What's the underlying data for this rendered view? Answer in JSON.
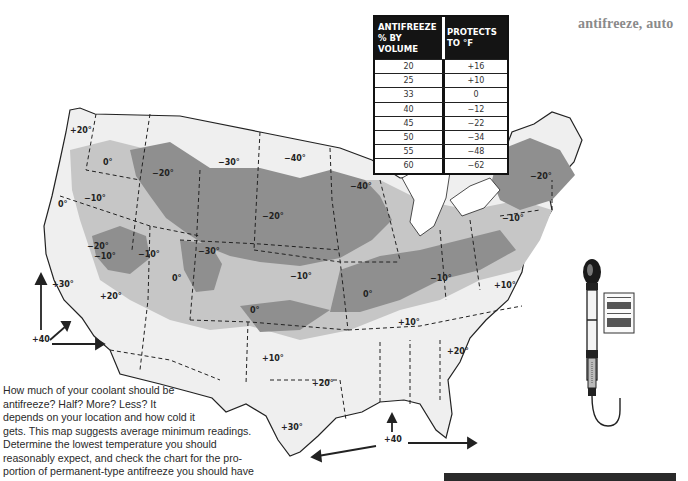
{
  "header": {
    "index_word": "antifreeze, auto"
  },
  "table": {
    "col1_header": "ANTIFREEZE % BY VOLUME",
    "col1_line1": "ANTIFREEZE",
    "col1_line2": "% BY VOLUME",
    "col2_header": "PROTECTS TO °F",
    "rows": [
      {
        "percent": "20",
        "protects": "+16"
      },
      {
        "percent": "25",
        "protects": "+10"
      },
      {
        "percent": "33",
        "protects": "0"
      },
      {
        "percent": "40",
        "protects": "−12"
      },
      {
        "percent": "45",
        "protects": "−22"
      },
      {
        "percent": "50",
        "protects": "−34"
      },
      {
        "percent": "55",
        "protects": "−48"
      },
      {
        "percent": "60",
        "protects": "−62"
      }
    ]
  },
  "caption": {
    "lines": [
      "How much of your coolant should be",
      "antifreeze? Half? More? Less? It",
      "depends on your location and how cold it",
      "gets. This map suggests average minimum readings.",
      "Determine the lowest temperature you should",
      "reasonably expect, and check the chart for the pro-",
      "portion of permanent-type antifreeze you should have"
    ]
  },
  "map": {
    "title": "US average minimum temperature map",
    "colors": {
      "coldest": "#8f8f8f",
      "cold": "#c4c4c4",
      "mild": "#e6e6e6",
      "border": "#222222"
    },
    "labels": [
      {
        "text": "+20°",
        "x": 70,
        "y": 132
      },
      {
        "text": "0°",
        "x": 103,
        "y": 164
      },
      {
        "text": "−10°",
        "x": 84,
        "y": 200
      },
      {
        "text": "0°",
        "x": 58,
        "y": 206
      },
      {
        "text": "−20°",
        "x": 152,
        "y": 175
      },
      {
        "text": "−30°",
        "x": 218,
        "y": 164
      },
      {
        "text": "−40°",
        "x": 284,
        "y": 160
      },
      {
        "text": "−40°",
        "x": 350,
        "y": 188
      },
      {
        "text": "−20°",
        "x": 262,
        "y": 218
      },
      {
        "text": "−20°",
        "x": 530,
        "y": 178
      },
      {
        "text": "−10°",
        "x": 502,
        "y": 220
      },
      {
        "text": "−20°",
        "x": 87,
        "y": 248
      },
      {
        "text": "−10°",
        "x": 94,
        "y": 258
      },
      {
        "text": "−10°",
        "x": 138,
        "y": 256
      },
      {
        "text": "−30°",
        "x": 198,
        "y": 253
      },
      {
        "text": "0°",
        "x": 172,
        "y": 280
      },
      {
        "text": "−10°",
        "x": 290,
        "y": 278
      },
      {
        "text": "+30°",
        "x": 52,
        "y": 286
      },
      {
        "text": "+20°",
        "x": 100,
        "y": 298
      },
      {
        "text": "0°",
        "x": 250,
        "y": 312
      },
      {
        "text": "0°",
        "x": 363,
        "y": 296
      },
      {
        "text": "−10°",
        "x": 430,
        "y": 280
      },
      {
        "text": "+10°",
        "x": 494,
        "y": 287
      },
      {
        "text": "+10°",
        "x": 398,
        "y": 324
      },
      {
        "text": "+10°",
        "x": 262,
        "y": 360
      },
      {
        "text": "+20°",
        "x": 312,
        "y": 385
      },
      {
        "text": "+20°",
        "x": 447,
        "y": 353
      },
      {
        "text": "+30°",
        "x": 281,
        "y": 429
      },
      {
        "text": "+40",
        "x": 32,
        "y": 341
      },
      {
        "text": "+40",
        "x": 384,
        "y": 441
      }
    ]
  },
  "illustration": {
    "name": "antifreeze hydrometer tester"
  }
}
